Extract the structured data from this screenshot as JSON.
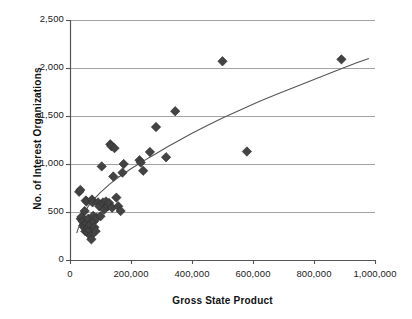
{
  "chart_data": {
    "type": "scatter",
    "title": "",
    "xlabel": "Gross State Product",
    "ylabel": "No. of Interest Organizations",
    "xlim": [
      0,
      1000000
    ],
    "ylim": [
      0,
      2500
    ],
    "xticks": [
      0,
      200000,
      400000,
      600000,
      800000,
      1000000
    ],
    "xtick_labels": [
      "0",
      "200,000",
      "400,000",
      "600,000",
      "800,000",
      "1,000,000"
    ],
    "yticks": [
      0,
      500,
      1000,
      1500,
      2000,
      2500
    ],
    "ytick_labels": [
      "0",
      "500",
      "1,000",
      "1,500",
      "2,000",
      "2,500"
    ],
    "grid": "horizontal",
    "legend": "none",
    "marker": "diamond",
    "marker_color": "#434343",
    "marker_size": 7,
    "gridline_color": "#999999",
    "axis_color": "#555555",
    "trendline": {
      "present": true,
      "style": "logarithmic fit",
      "color": "#555555",
      "points": [
        [
          22000,
          280
        ],
        [
          40000,
          450
        ],
        [
          60000,
          560
        ],
        [
          80000,
          640
        ],
        [
          100000,
          705
        ],
        [
          130000,
          790
        ],
        [
          160000,
          865
        ],
        [
          200000,
          950
        ],
        [
          240000,
          1030
        ],
        [
          280000,
          1105
        ],
        [
          320000,
          1180
        ],
        [
          360000,
          1250
        ],
        [
          400000,
          1320
        ],
        [
          450000,
          1400
        ],
        [
          500000,
          1480
        ],
        [
          560000,
          1565
        ],
        [
          620000,
          1650
        ],
        [
          680000,
          1730
        ],
        [
          740000,
          1805
        ],
        [
          800000,
          1880
        ],
        [
          860000,
          1955
        ],
        [
          900000,
          2005
        ],
        [
          940000,
          2055
        ],
        [
          980000,
          2100
        ]
      ]
    },
    "points": [
      [
        30000,
        710
      ],
      [
        34000,
        730
      ],
      [
        35000,
        430
      ],
      [
        38000,
        450
      ],
      [
        42000,
        400
      ],
      [
        44000,
        360
      ],
      [
        46000,
        340
      ],
      [
        48000,
        510
      ],
      [
        50000,
        300
      ],
      [
        52000,
        620
      ],
      [
        54000,
        610
      ],
      [
        55000,
        380
      ],
      [
        57000,
        330
      ],
      [
        58000,
        290
      ],
      [
        60000,
        430
      ],
      [
        62000,
        350
      ],
      [
        64000,
        310
      ],
      [
        66000,
        370
      ],
      [
        68000,
        250
      ],
      [
        70000,
        215
      ],
      [
        72000,
        630
      ],
      [
        74000,
        600
      ],
      [
        76000,
        460
      ],
      [
        78000,
        400
      ],
      [
        80000,
        340
      ],
      [
        84000,
        300
      ],
      [
        88000,
        440
      ],
      [
        92000,
        600
      ],
      [
        96000,
        560
      ],
      [
        100000,
        455
      ],
      [
        104000,
        975
      ],
      [
        108000,
        600
      ],
      [
        112000,
        525
      ],
      [
        118000,
        610
      ],
      [
        124000,
        560
      ],
      [
        128000,
        595
      ],
      [
        132000,
        1205
      ],
      [
        136000,
        1185
      ],
      [
        138000,
        545
      ],
      [
        142000,
        870
      ],
      [
        146000,
        1165
      ],
      [
        152000,
        650
      ],
      [
        158000,
        560
      ],
      [
        166000,
        510
      ],
      [
        172000,
        910
      ],
      [
        176000,
        1000
      ],
      [
        228000,
        1040
      ],
      [
        232000,
        1015
      ],
      [
        240000,
        930
      ],
      [
        262000,
        1125
      ],
      [
        282000,
        1385
      ],
      [
        315000,
        1070
      ],
      [
        345000,
        1550
      ],
      [
        500000,
        2070
      ],
      [
        580000,
        1130
      ],
      [
        890000,
        2090
      ]
    ]
  }
}
